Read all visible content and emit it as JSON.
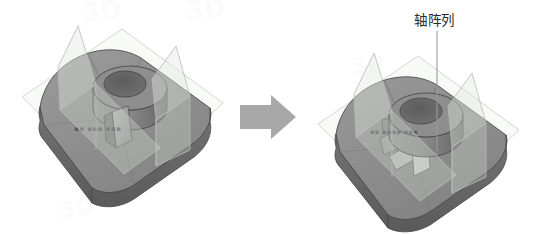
{
  "canvas": {
    "width": 539,
    "height": 234,
    "background": "#ffffff"
  },
  "annotation": {
    "label": "轴阵列",
    "leader_color": "#9a9a9a"
  },
  "arrow": {
    "name": "transition-arrow",
    "direction": "right",
    "color": "#a8a8a8"
  },
  "watermark": {
    "text": "3D",
    "color": "#fbfbfb"
  },
  "palette": {
    "body_top": "#8d8d8d",
    "body_top_light": "#9a9a9a",
    "body_side": "#6f6f6f",
    "body_side_dark": "#5c5c5c",
    "boss_light": "#8f8f8f",
    "boss_dark": "#6a6a6a",
    "hole": "#595959",
    "fin": "#a5a5a5",
    "fin_dark": "#7b7b7b",
    "plane_fill": "#dfe6de",
    "plane_edge": "#b9bfb8",
    "ground_fill": "#f2f4f1",
    "ground_edge": "#c6ccc5",
    "outline": "#4d4d4d",
    "etch_text": "#4a4a4a"
  },
  "models": [
    {
      "name": "model-before",
      "caption_etch": "",
      "fin_count": 1,
      "has_leader": false
    },
    {
      "name": "model-after",
      "caption_etch": "",
      "fin_count": 6,
      "has_leader": true
    }
  ]
}
